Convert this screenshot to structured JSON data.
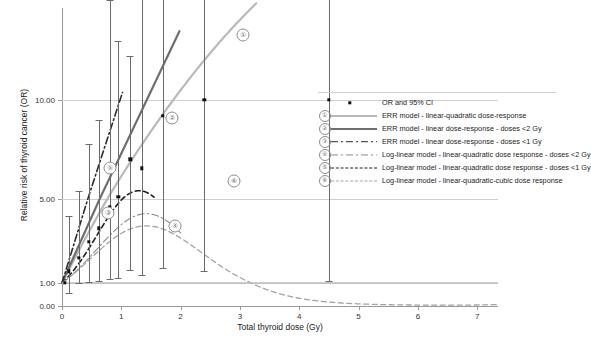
{
  "chart_data": {
    "type": "line",
    "title": "",
    "xlabel": "Total thyroid dose (Gy)",
    "ylabel": "Relative risk of thyroid cancer (OR)",
    "xlim": [
      0,
      7.35
    ],
    "ylim_labels": [
      "0.00",
      "1.00",
      "5.00",
      "10.00"
    ],
    "xticks": [
      0,
      1,
      2,
      3,
      4,
      5,
      6,
      7
    ],
    "xtick_labels": [
      "0",
      "1",
      "2",
      "3",
      "4",
      "5",
      "6",
      "7"
    ],
    "yticks": [
      0.0,
      1.0,
      5.0,
      10.0
    ],
    "ytick_labels": [
      "0.00",
      "1.00",
      "5.00",
      "10.00"
    ],
    "grid": "horizontal",
    "legend_position": "right",
    "points": [
      {
        "x": 0.05,
        "or": 1.0,
        "lo": 1.0,
        "hi": 1.0
      },
      {
        "x": 0.12,
        "or": 1.55,
        "lo": 0.55,
        "hi": 4.2
      },
      {
        "x": 0.28,
        "or": 2.2,
        "lo": 1.0,
        "hi": 5.4
      },
      {
        "x": 0.45,
        "or": 2.95,
        "lo": 1.05,
        "hi": 7.8
      },
      {
        "x": 0.62,
        "or": 3.6,
        "lo": 1.1,
        "hi": 9.0
      },
      {
        "x": 0.8,
        "or": 4.6,
        "lo": 1.2,
        "hi": 15.5
      },
      {
        "x": 0.95,
        "or": 5.1,
        "lo": 1.25,
        "hi": 13.0
      },
      {
        "x": 1.15,
        "or": 7.0,
        "lo": 1.6,
        "hi": 12.2
      },
      {
        "x": 1.35,
        "or": 6.55,
        "lo": 1.4,
        "hi": 20.0
      },
      {
        "x": 1.7,
        "or": 9.2,
        "lo": 1.7,
        "hi": 20.0
      },
      {
        "x": 2.4,
        "or": 10.0,
        "lo": 1.55,
        "hi": 20.0
      },
      {
        "x": 4.5,
        "or": 10.0,
        "lo": 1.1,
        "hi": 20.0
      }
    ],
    "curves": [
      {
        "id": 1,
        "label": "①",
        "name": "ERR model - linear-quadratic dose-response",
        "style": "solid",
        "color": "#b9b9b9",
        "width": 2.2,
        "plot_label_at": {
          "x": 3.05,
          "y": 13.3
        }
      },
      {
        "id": 2,
        "label": "②",
        "name": "ERR model - linear dose-response - doses <2 Gy",
        "style": "solid",
        "color": "#6e6e6e",
        "width": 2.2,
        "plot_label_at": {
          "x": 1.85,
          "y": 9.1
        }
      },
      {
        "id": 3,
        "label": "③",
        "name": "ERR model - linear dose-response - doses <1 Gy",
        "style": "dashdot",
        "color": "#2b2b2b",
        "width": 1.6,
        "plot_label_at": {
          "x": 0.78,
          "y": 4.35
        }
      },
      {
        "id": 4,
        "label": "④",
        "name": "Log-linear model - linear-quadratic dose response - doses <2 Gy",
        "style": "dashdot",
        "color": "#8a8a8a",
        "width": 1.1,
        "plot_label_at": {
          "x": 1.9,
          "y": 3.7
        }
      },
      {
        "id": 5,
        "label": "⑤",
        "name": "Log-linear model - linear-quadratic dose response - doses <1 Gy",
        "style": "dashed",
        "color": "#1f1f1f",
        "width": 1.6,
        "plot_label_at": {
          "x": 0.8,
          "y": 6.55
        }
      },
      {
        "id": 6,
        "label": "⑥",
        "name": "Log-linear model - linear-quadratic-cubic dose response",
        "style": "dashed",
        "color": "#a3a3a3",
        "width": 1.3,
        "plot_label_at": {
          "x": 2.9,
          "y": 5.9
        }
      }
    ],
    "baseline": {
      "value": 1.0,
      "description": "reference line at OR = 1.00"
    }
  },
  "legend": {
    "marker_row": {
      "symbol": "diamond",
      "label": "OR and 95% CI"
    },
    "rows": [
      {
        "num": "①",
        "label": "ERR model - linear-quadratic dose-response"
      },
      {
        "num": "②",
        "label": "ERR model - linear dose-response - doses <2 Gy"
      },
      {
        "num": "③",
        "label": "ERR model - linear dose-response - doses <1 Gy"
      },
      {
        "num": "④",
        "label": "Log-linear model - linear-quadratic dose response - doses <2 Gy"
      },
      {
        "num": "⑤",
        "label": "Log-linear model - linear-quadratic dose response - doses <1 Gy"
      },
      {
        "num": "⑥",
        "label": "Log-linear model - linear-quadratic-cubic dose response"
      }
    ]
  },
  "colors": {
    "curve1": "#b9b9b9",
    "curve2": "#6e6e6e",
    "curve3": "#2b2b2b",
    "curve4": "#8a8a8a",
    "curve5": "#1f1f1f",
    "curve6": "#a3a3a3",
    "marker": "#111111",
    "errorbar": "#6b6b6b",
    "grid": "#cfcfcf",
    "axis": "#9a9a9a"
  }
}
